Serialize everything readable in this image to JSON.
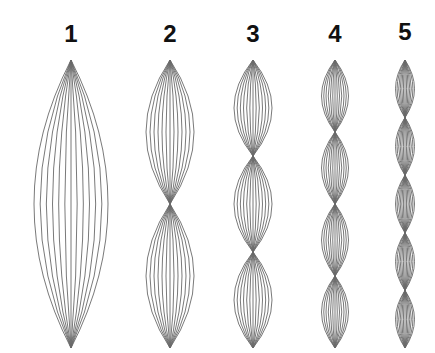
{
  "diagram": {
    "line_color": "#6a6a6a",
    "label_color": "#111111",
    "top_y": 60,
    "bottom_y": 348,
    "curves_per_loop": 6,
    "modes": [
      {
        "label": "1",
        "loops": 1,
        "center_x": 71,
        "half_width": 37,
        "label_y": 42
      },
      {
        "label": "2",
        "loops": 2,
        "center_x": 170,
        "half_width": 24,
        "label_y": 42
      },
      {
        "label": "3",
        "loops": 3,
        "center_x": 253,
        "half_width": 19,
        "label_y": 42
      },
      {
        "label": "4",
        "loops": 4,
        "center_x": 335,
        "half_width": 13.5,
        "label_y": 42
      },
      {
        "label": "5",
        "loops": 5,
        "center_x": 405,
        "half_width": 9.5,
        "label_y": 40
      }
    ]
  }
}
